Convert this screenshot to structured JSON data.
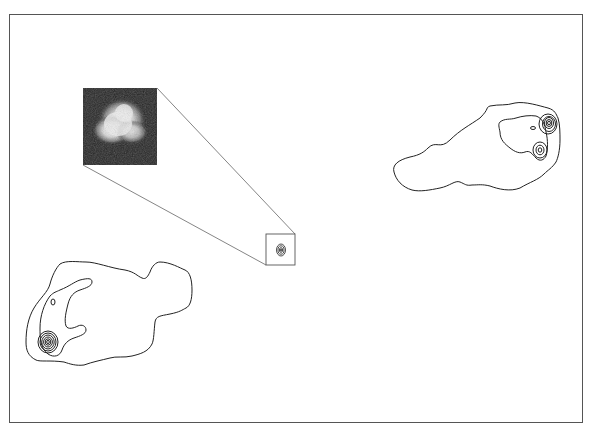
{
  "figure": {
    "frame": {
      "x": 9,
      "y": 14,
      "width": 574,
      "height": 409,
      "stroke": "#555555"
    },
    "inset": {
      "label": "core-image-inset",
      "x": 83,
      "y": 88,
      "width": 74,
      "height": 77,
      "background": "#222222",
      "glow": "#e8e8e8"
    },
    "core_box": {
      "x": 266,
      "y": 234,
      "width": 29,
      "height": 31
    },
    "connector_lines": [
      {
        "from": [
          157,
          88
        ],
        "to": [
          295,
          234
        ]
      },
      {
        "from": [
          83,
          165
        ],
        "to": [
          266,
          265
        ]
      }
    ],
    "lobes": [
      {
        "name": "north-east-lobe",
        "hotspots": 2
      },
      {
        "name": "south-west-lobe",
        "hotspots": 1
      }
    ],
    "colors": {
      "contour": "#222222",
      "background": "#ffffff"
    }
  }
}
